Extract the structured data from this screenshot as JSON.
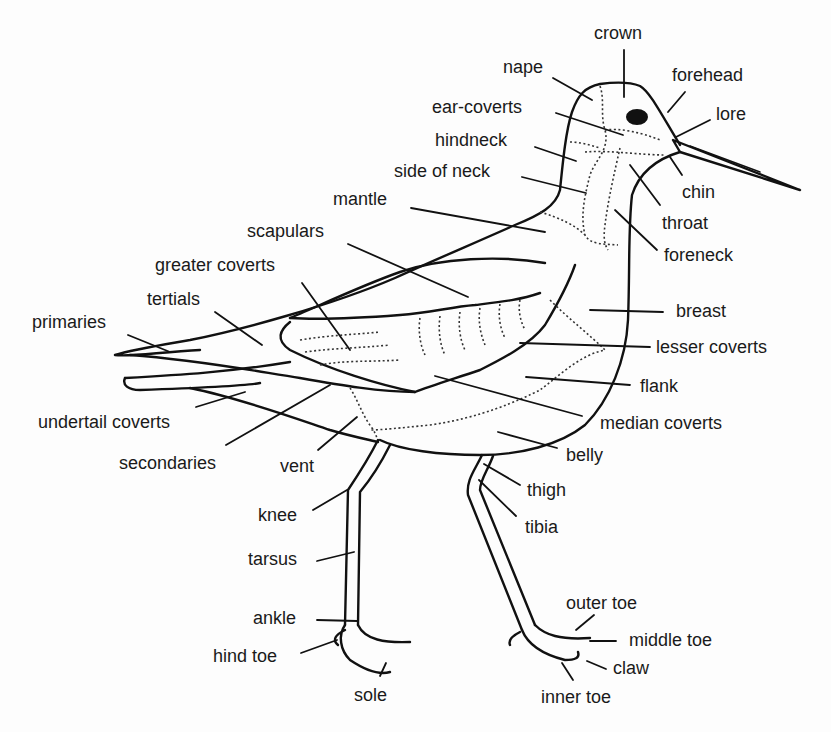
{
  "diagram": {
    "labels": [
      {
        "id": "crown",
        "text": "crown",
        "x": 594,
        "y": 24
      },
      {
        "id": "nape",
        "text": "nape",
        "x": 503,
        "y": 58
      },
      {
        "id": "forehead",
        "text": "forehead",
        "x": 672,
        "y": 66
      },
      {
        "id": "ear-coverts",
        "text": "ear-coverts",
        "x": 432,
        "y": 98
      },
      {
        "id": "lore",
        "text": "lore",
        "x": 716,
        "y": 105
      },
      {
        "id": "hindneck",
        "text": "hindneck",
        "x": 435,
        "y": 131
      },
      {
        "id": "side-of-neck",
        "text": "side of neck",
        "x": 394,
        "y": 162
      },
      {
        "id": "chin",
        "text": "chin",
        "x": 682,
        "y": 183
      },
      {
        "id": "mantle",
        "text": "mantle",
        "x": 333,
        "y": 190
      },
      {
        "id": "throat",
        "text": "throat",
        "x": 662,
        "y": 214
      },
      {
        "id": "scapulars",
        "text": "scapulars",
        "x": 247,
        "y": 222
      },
      {
        "id": "foreneck",
        "text": "foreneck",
        "x": 664,
        "y": 246
      },
      {
        "id": "greater-coverts",
        "text": "greater coverts",
        "x": 155,
        "y": 256
      },
      {
        "id": "tertials",
        "text": "tertials",
        "x": 147,
        "y": 290
      },
      {
        "id": "breast",
        "text": "breast",
        "x": 676,
        "y": 302
      },
      {
        "id": "primaries",
        "text": "primaries",
        "x": 32,
        "y": 313
      },
      {
        "id": "lesser-coverts",
        "text": "lesser coverts",
        "x": 656,
        "y": 338
      },
      {
        "id": "flank",
        "text": "flank",
        "x": 640,
        "y": 377
      },
      {
        "id": "undertail-coverts",
        "text": "undertail coverts",
        "x": 38,
        "y": 413
      },
      {
        "id": "median-coverts",
        "text": "median coverts",
        "x": 600,
        "y": 414
      },
      {
        "id": "belly",
        "text": "belly",
        "x": 566,
        "y": 446
      },
      {
        "id": "secondaries",
        "text": "secondaries",
        "x": 119,
        "y": 454
      },
      {
        "id": "vent",
        "text": "vent",
        "x": 280,
        "y": 457
      },
      {
        "id": "thigh",
        "text": "thigh",
        "x": 527,
        "y": 481
      },
      {
        "id": "knee",
        "text": "knee",
        "x": 258,
        "y": 506
      },
      {
        "id": "tibia",
        "text": "tibia",
        "x": 525,
        "y": 518
      },
      {
        "id": "tarsus",
        "text": "tarsus",
        "x": 248,
        "y": 550
      },
      {
        "id": "outer-toe",
        "text": "outer toe",
        "x": 566,
        "y": 594
      },
      {
        "id": "ankle",
        "text": "ankle",
        "x": 253,
        "y": 609
      },
      {
        "id": "middle-toe",
        "text": "middle toe",
        "x": 629,
        "y": 631
      },
      {
        "id": "hind-toe",
        "text": "hind toe",
        "x": 213,
        "y": 647
      },
      {
        "id": "claw",
        "text": "claw",
        "x": 613,
        "y": 659
      },
      {
        "id": "sole",
        "text": "sole",
        "x": 354,
        "y": 686
      },
      {
        "id": "inner-toe",
        "text": "inner toe",
        "x": 541,
        "y": 688
      }
    ]
  }
}
